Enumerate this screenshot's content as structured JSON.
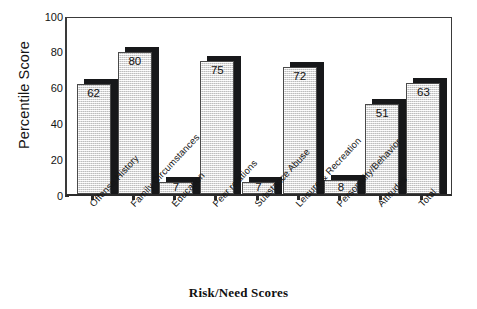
{
  "chart_data": {
    "type": "bar",
    "title": "",
    "xlabel": "Risk/Need Scores",
    "ylabel": "Percentile Score",
    "ylim": [
      0,
      100
    ],
    "yticks": [
      0,
      20,
      40,
      60,
      80,
      100
    ],
    "grid": false,
    "legend": "none",
    "categories": [
      "Offense History",
      "Family Circumstances",
      "Education",
      "Peer relations",
      "Substance Abuse",
      "Leisure & Recreation",
      "Personality/Behavior",
      "Attitudes",
      "Total"
    ],
    "values": [
      62,
      80,
      7,
      75,
      7,
      72,
      8,
      51,
      63
    ],
    "value_labels": [
      "62",
      "80",
      "7",
      "75",
      "7",
      "72",
      "8",
      "51",
      "63"
    ],
    "bar_fill_color": "#e9e9e9",
    "bar_shadow_color": "#17181a",
    "axis_color": "#2b2b2b"
  },
  "axis": {
    "y_title": "Percentile Score",
    "x_title": "Risk/Need Scores",
    "y_tick_labels": [
      "100",
      "80",
      "60",
      "40",
      "20",
      "0"
    ]
  }
}
